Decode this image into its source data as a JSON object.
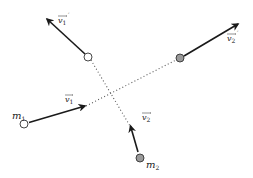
{
  "diagram": {
    "colors": {
      "vector": "#1a1a1a",
      "trajectory": "#555555",
      "mass1_fill": "#ffffff",
      "mass2_fill": "#9a9a9a",
      "outline": "#333333"
    },
    "masses": [
      {
        "id": "m1",
        "label": "m",
        "sub": "1",
        "fill": "#ffffff",
        "x": 24,
        "y": 124
      },
      {
        "id": "m2",
        "label": "m",
        "sub": "2",
        "fill": "#9a9a9a",
        "x": 140,
        "y": 158
      },
      {
        "id": "m1_after",
        "label": "",
        "fill": "#ffffff",
        "x": 88,
        "y": 57
      },
      {
        "id": "m2_after",
        "label": "",
        "fill": "#9a9a9a",
        "x": 180,
        "y": 58
      }
    ],
    "vectors": [
      {
        "id": "v1",
        "label": "v",
        "sub": "1",
        "prime": false
      },
      {
        "id": "v2",
        "label": "v",
        "sub": "2",
        "prime": false
      },
      {
        "id": "v1_prime",
        "label": "v",
        "sub": "1",
        "prime": true
      },
      {
        "id": "v2_prime",
        "label": "v",
        "sub": "2",
        "prime": true
      }
    ],
    "labels": {
      "m1": "m",
      "m1_sub": "1",
      "m2": "m",
      "m2_sub": "2",
      "v1": "v",
      "v1_sub": "1",
      "v2": "v",
      "v2_sub": "2",
      "v1p": "v",
      "v1p_sub": "1",
      "v1p_prime": "′",
      "v2p": "v",
      "v2p_sub": "2",
      "v2p_prime": "′"
    }
  }
}
